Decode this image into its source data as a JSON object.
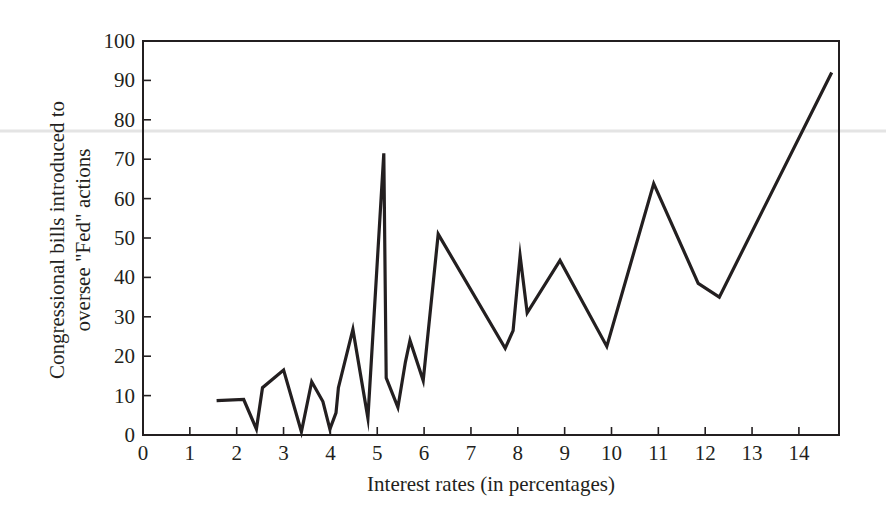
{
  "chart_data": {
    "type": "line",
    "title": "",
    "xlabel": "Interest rates (in percentages)",
    "ylabel_lines": [
      "Congressional bills introduced to",
      "oversee \"Fed\" actions"
    ],
    "ylabel": "Congressional bills introduced to oversee \"Fed\" actions",
    "xlim": [
      0,
      14.85
    ],
    "ylim": [
      0,
      100
    ],
    "x_ticks": [
      0,
      1,
      2,
      3,
      4,
      5,
      6,
      7,
      8,
      9,
      10,
      11,
      12,
      13,
      14
    ],
    "y_ticks": [
      0,
      10,
      20,
      30,
      40,
      50,
      60,
      70,
      80,
      90,
      100
    ],
    "grid": false,
    "legend": null,
    "series": [
      {
        "name": "Congressional bills",
        "color": "#231f20",
        "x": [
          1.57,
          2.15,
          2.42,
          2.55,
          3.0,
          3.38,
          3.6,
          3.84,
          3.99,
          4.12,
          4.17,
          4.48,
          4.8,
          5.14,
          5.19,
          5.44,
          5.6,
          5.7,
          5.98,
          6.3,
          7.73,
          7.9,
          8.05,
          8.2,
          8.9,
          9.9,
          10.9,
          11.85,
          12.3,
          14.7
        ],
        "y": [
          8.7,
          9,
          1.5,
          12,
          16.5,
          0.8,
          13.5,
          8.5,
          1.5,
          5.6,
          12,
          26.8,
          4.3,
          71.5,
          14.5,
          7,
          18.5,
          24,
          13.8,
          51,
          22,
          26.5,
          45.5,
          31,
          44.3,
          22.5,
          63.8,
          38.5,
          35,
          92
        ]
      }
    ]
  }
}
